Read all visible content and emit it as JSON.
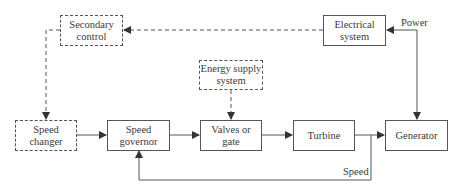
{
  "diagram": {
    "title": "",
    "blocks": {
      "secondary_control": {
        "label_1": "Secondary",
        "label_2": "control",
        "style": "dashed"
      },
      "electrical_system": {
        "label_1": "Electrical",
        "label_2": "system",
        "style": "solid"
      },
      "energy_supply": {
        "label_1": "Energy supply",
        "label_2": "system",
        "style": "dashed"
      },
      "speed_changer": {
        "label_1": "Speed",
        "label_2": "changer",
        "style": "dashed"
      },
      "speed_governor": {
        "label_1": "Speed",
        "label_2": "governor",
        "style": "solid"
      },
      "valves_gate": {
        "label_1": "Valves or",
        "label_2": "gate",
        "style": "solid"
      },
      "turbine": {
        "label_1": "Turbine",
        "style": "solid"
      },
      "generator": {
        "label_1": "Generator",
        "style": "solid"
      }
    },
    "edge_labels": {
      "power": "Power",
      "speed": "Speed"
    },
    "colors": {
      "line": "#555555",
      "text": "#3a3a3a",
      "background": "#ffffff"
    }
  }
}
